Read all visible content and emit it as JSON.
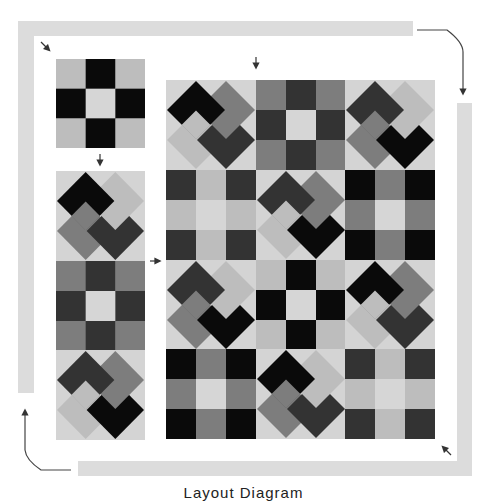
{
  "caption": "Layout Diagram",
  "colors": {
    "black": "#0a0a0a",
    "dark": "#333333",
    "mid": "#7d7d7d",
    "light": "#bdbdbd",
    "pale": "#d6d6d6",
    "background": "#d4d4d4",
    "border_strip": "#dcdcdc",
    "arrow": "#333333"
  },
  "single_block": {
    "type": "nine-patch",
    "cells": [
      "light",
      "black",
      "light",
      "black",
      "pale",
      "black",
      "light",
      "black",
      "light"
    ]
  },
  "left_column": [
    {
      "type": "pinwheel",
      "tl": "black",
      "tr": "light",
      "bl": "mid",
      "br": "dark"
    },
    {
      "type": "nine-patch",
      "cells": [
        "mid",
        "dark",
        "mid",
        "dark",
        "pale",
        "dark",
        "mid",
        "dark",
        "mid"
      ]
    },
    {
      "type": "pinwheel",
      "tl": "dark",
      "tr": "mid",
      "bl": "light",
      "br": "black"
    }
  ],
  "main_grid": [
    [
      {
        "type": "pinwheel",
        "tl": "black",
        "tr": "mid",
        "bl": "light",
        "br": "dark"
      },
      {
        "type": "nine-patch",
        "cells": [
          "mid",
          "dark",
          "mid",
          "dark",
          "pale",
          "dark",
          "mid",
          "dark",
          "mid"
        ]
      },
      {
        "type": "pinwheel",
        "tl": "dark",
        "tr": "light",
        "bl": "mid",
        "br": "black"
      }
    ],
    [
      {
        "type": "nine-patch",
        "cells": [
          "dark",
          "light",
          "dark",
          "light",
          "pale",
          "light",
          "dark",
          "light",
          "dark"
        ]
      },
      {
        "type": "pinwheel",
        "tl": "dark",
        "tr": "mid",
        "bl": "light",
        "br": "black"
      },
      {
        "type": "nine-patch",
        "cells": [
          "black",
          "mid",
          "black",
          "mid",
          "pale",
          "mid",
          "black",
          "mid",
          "black"
        ]
      }
    ],
    [
      {
        "type": "pinwheel",
        "tl": "dark",
        "tr": "light",
        "bl": "mid",
        "br": "black"
      },
      {
        "type": "nine-patch",
        "cells": [
          "light",
          "black",
          "light",
          "black",
          "pale",
          "black",
          "light",
          "black",
          "light"
        ]
      },
      {
        "type": "pinwheel",
        "tl": "black",
        "tr": "mid",
        "bl": "light",
        "br": "dark"
      }
    ],
    [
      {
        "type": "nine-patch",
        "cells": [
          "black",
          "mid",
          "black",
          "mid",
          "pale",
          "mid",
          "black",
          "mid",
          "black"
        ]
      },
      {
        "type": "pinwheel",
        "tl": "black",
        "tr": "light",
        "bl": "mid",
        "br": "dark"
      },
      {
        "type": "nine-patch",
        "cells": [
          "dark",
          "light",
          "dark",
          "light",
          "pale",
          "light",
          "dark",
          "light",
          "dark"
        ]
      }
    ]
  ]
}
